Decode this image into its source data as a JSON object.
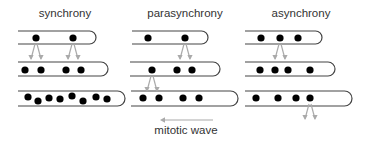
{
  "colors": {
    "tube": "#444444",
    "nucleus": "#000000",
    "arrow": "#aaaaaa",
    "text": "#333333"
  },
  "panels": [
    {
      "title": "synchrony",
      "title_x": 65,
      "tubes": [
        {
          "x": 18,
          "y": 31,
          "w": 78,
          "h": 13,
          "nuclei": [
            [
              36,
              38
            ],
            [
              73,
              38
            ]
          ]
        },
        {
          "x": 18,
          "y": 62,
          "w": 90,
          "h": 14,
          "nuclei": [
            [
              25,
              70
            ],
            [
              41,
              70
            ],
            [
              66,
              70
            ],
            [
              81,
              70
            ]
          ]
        },
        {
          "x": 18,
          "y": 91,
          "w": 107,
          "h": 15,
          "nuclei": [
            [
              28,
              97
            ],
            [
              38,
              101
            ],
            [
              49,
              98
            ],
            [
              60,
              99
            ],
            [
              72,
              96
            ],
            [
              83,
              101
            ],
            [
              96,
              97
            ],
            [
              107,
              99
            ]
          ]
        }
      ],
      "arrows": [
        [
          36,
          42
        ],
        [
          73,
          42
        ]
      ]
    },
    {
      "title": "parasynchrony",
      "title_x": 185,
      "tubes": [
        {
          "x": 132,
          "y": 31,
          "w": 76,
          "h": 13,
          "nuclei": [
            [
              148,
              38
            ],
            [
              185,
              38
            ]
          ]
        },
        {
          "x": 130,
          "y": 62,
          "w": 90,
          "h": 14,
          "nuclei": [
            [
              152,
              70
            ],
            [
              177,
              70
            ],
            [
              192,
              70
            ]
          ]
        },
        {
          "x": 131,
          "y": 91,
          "w": 107,
          "h": 15,
          "nuclei": [
            [
              143,
              98
            ],
            [
              159,
              98
            ],
            [
              183,
              98
            ],
            [
              199,
              98
            ]
          ]
        }
      ],
      "arrows": [
        [
          185,
          42
        ],
        [
          152,
          74
        ]
      ]
    },
    {
      "title": "asynchrony",
      "title_x": 301,
      "tubes": [
        {
          "x": 245,
          "y": 31,
          "w": 77,
          "h": 13,
          "nuclei": [
            [
              261,
              38
            ],
            [
              280,
              38
            ],
            [
              298,
              38
            ]
          ]
        },
        {
          "x": 245,
          "y": 62,
          "w": 90,
          "h": 14,
          "nuclei": [
            [
              260,
              70
            ],
            [
              275,
              70
            ],
            [
              288,
              70
            ],
            [
              310,
              70
            ]
          ]
        },
        {
          "x": 245,
          "y": 91,
          "w": 107,
          "h": 15,
          "nuclei": [
            [
              256,
              98
            ],
            [
              278,
              98
            ],
            [
              296,
              98
            ],
            [
              310,
              98
            ]
          ]
        }
      ],
      "arrows": [
        [
          280,
          42
        ],
        [
          310,
          102
        ]
      ]
    }
  ],
  "mitotic_wave": {
    "label": "mitotic wave",
    "arrow_from_x": 213,
    "arrow_to_x": 160,
    "arrow_y": 120,
    "label_x": 186,
    "label_y": 134
  }
}
